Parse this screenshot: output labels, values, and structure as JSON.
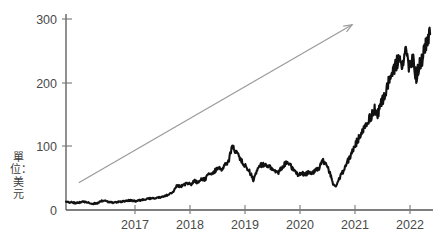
{
  "chart_data": {
    "type": "line",
    "title": "",
    "subtitle": "",
    "xlabel": "",
    "ylabel": "單位：美元",
    "ylabel_chars": [
      "單",
      "位",
      "：",
      "美",
      "元"
    ],
    "xlim": [
      2016.1,
      2022.45
    ],
    "ylim": [
      0,
      310
    ],
    "y_ticks": [
      0,
      100,
      200,
      300
    ],
    "y_tick_labels": [
      "0",
      "100",
      "200",
      "300"
    ],
    "x_ticks": [
      2017,
      2018,
      2019,
      2020,
      2021,
      2022
    ],
    "x_tick_labels": [
      "2017",
      "2018",
      "2019",
      "2020",
      "2021",
      "2022"
    ],
    "grid": false,
    "legend": false,
    "series": [
      {
        "name": "price",
        "color": "#111111",
        "x": [
          2016.1,
          2016.16,
          2016.22,
          2016.28,
          2016.34,
          2016.4,
          2016.46,
          2016.52,
          2016.58,
          2016.64,
          2016.7,
          2016.76,
          2016.82,
          2016.88,
          2016.94,
          2017.0,
          2017.06,
          2017.12,
          2017.18,
          2017.24,
          2017.3,
          2017.36,
          2017.42,
          2017.48,
          2017.54,
          2017.6,
          2017.66,
          2017.72,
          2017.78,
          2017.84,
          2017.9,
          2017.96,
          2018.02,
          2018.08,
          2018.14,
          2018.2,
          2018.26,
          2018.32,
          2018.38,
          2018.44,
          2018.5,
          2018.56,
          2018.62,
          2018.68,
          2018.74,
          2018.8,
          2018.86,
          2018.92,
          2018.98,
          2019.04,
          2019.1,
          2019.16,
          2019.22,
          2019.28,
          2019.34,
          2019.4,
          2019.46,
          2019.52,
          2019.58,
          2019.64,
          2019.7,
          2019.76,
          2019.82,
          2019.88,
          2019.94,
          2020.0,
          2020.06,
          2020.12,
          2020.18,
          2020.24,
          2020.3,
          2020.36,
          2020.42,
          2020.48,
          2020.54,
          2020.6,
          2020.66,
          2020.72,
          2020.78,
          2020.84,
          2020.9,
          2020.96,
          2021.02,
          2021.08,
          2021.14,
          2021.2,
          2021.26,
          2021.32,
          2021.38,
          2021.44,
          2021.5,
          2021.56,
          2021.62,
          2021.68,
          2021.74,
          2021.8,
          2021.86,
          2021.92,
          2021.98,
          2022.04,
          2022.1,
          2022.16,
          2022.22,
          2022.28,
          2022.34,
          2022.4
        ],
        "y": [
          13,
          12,
          12,
          11,
          12,
          13,
          12,
          11,
          10,
          11,
          14,
          15,
          13,
          12,
          12,
          13,
          13,
          14,
          15,
          15,
          14,
          15,
          16,
          17,
          18,
          18,
          19,
          20,
          21,
          23,
          26,
          28,
          40,
          37,
          39,
          43,
          40,
          46,
          44,
          50,
          48,
          55,
          58,
          62,
          66,
          64,
          72,
          80,
          100,
          92,
          85,
          75,
          68,
          60,
          48,
          60,
          70,
          72,
          71,
          68,
          62,
          58,
          66,
          72,
          76,
          68,
          60,
          56,
          58,
          56,
          60,
          58,
          62,
          66,
          78,
          72,
          60,
          42,
          38,
          52,
          62,
          74,
          86,
          96,
          110,
          120,
          132,
          140,
          148,
          160,
          152,
          170,
          186,
          200,
          214,
          230,
          242,
          230,
          248,
          222,
          238,
          212,
          228,
          246,
          262,
          278
        ]
      }
    ],
    "series_detail_note": "daily-resolution price path drawn from control points",
    "annotations": [
      {
        "type": "arrow",
        "name": "trend-arrow",
        "color": "#9a9a9a",
        "from": {
          "x": 2016.32,
          "y": 43
        },
        "to": {
          "x": 2021.05,
          "y": 293
        },
        "description": "grey upward trend arrow"
      }
    ],
    "notable_points": {
      "start_value": 13,
      "peak_2018": 100,
      "peak_2021_early": 280,
      "peak_2021_late": 278,
      "trough_2020": 38,
      "end_low": 95,
      "end_value": 120
    }
  },
  "axis": {
    "y_unit_label": "單位：美元"
  }
}
